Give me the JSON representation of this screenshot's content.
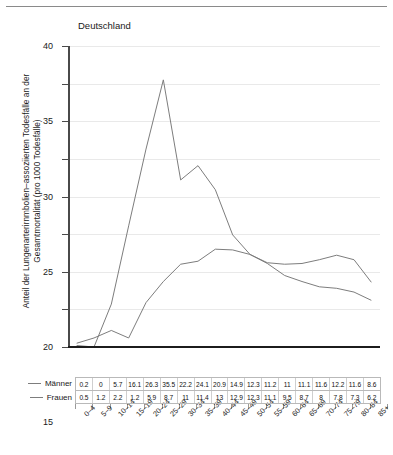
{
  "chart_data": {
    "type": "line",
    "title": "Deutschland",
    "xlabel": "",
    "ylabel": "Anteil der Lungenarterirnmbolien–assoziierten Todesfälle an der Gesamtmortalität (pro 1000 Todesfälle)",
    "ylim": [
      0,
      40
    ],
    "yticks": [
      0,
      5,
      10,
      15,
      20,
      25,
      30,
      35,
      40
    ],
    "grid": true,
    "legend_position": "left-of-table",
    "categories": [
      "0–4",
      "5–9",
      "10–14",
      "15–19",
      "20–24",
      "25–29",
      "30–34",
      "35–39",
      "40–44",
      "45–49",
      "50–54",
      "55–59",
      "60–64",
      "65–69",
      "70–74",
      "75–79",
      "80–84",
      "85+"
    ],
    "series": [
      {
        "name": "Männer",
        "values": [
          0.2,
          0,
          5.7,
          16.1,
          26.3,
          35.5,
          22.2,
          24.1,
          20.9,
          14.9,
          12.3,
          11.2,
          11,
          11.1,
          11.6,
          12.2,
          11.6,
          8.6
        ]
      },
      {
        "name": "Frauen",
        "values": [
          0.5,
          1.2,
          2.2,
          1.2,
          5.9,
          8.7,
          11,
          11.4,
          13,
          12.9,
          12.3,
          11.1,
          9.5,
          8.7,
          8,
          7.8,
          7.3,
          6.2
        ]
      }
    ],
    "colors": {
      "series_line": "#7d7d7d",
      "axis": "#1c1c1c",
      "gridline": "#e9e9e9",
      "table_border": "#b9b9b9"
    }
  }
}
